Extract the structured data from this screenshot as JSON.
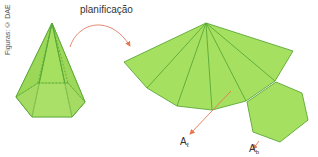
{
  "credit": "Figuras: © DAE",
  "caption": "planificação",
  "labels": {
    "lateral_area": {
      "main": "A",
      "sub": "ℓ"
    },
    "base_area": {
      "main": "A",
      "sub": "b"
    }
  },
  "colors": {
    "fill": "#a6e060",
    "fill_light": "#b4e878",
    "edge": "#5aa838",
    "arrow": "#e8774f",
    "curve": "#e07860"
  },
  "figure": {
    "solid": "hexagonal pyramid",
    "net": "6 triangular lateral faces + hexagonal base"
  }
}
